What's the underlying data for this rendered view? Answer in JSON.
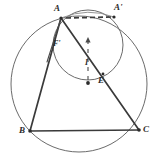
{
  "figure": {
    "background_color": "#ffffff",
    "stroke_color": "#3a3a3a",
    "thin_stroke_color": "#6b6b6b",
    "label_color": "#2b2b2b",
    "labels": [
      {
        "id": "A",
        "text": "A",
        "x": 54,
        "y": 4,
        "size": "normal"
      },
      {
        "id": "Ap",
        "text": "A'",
        "x": 114,
        "y": 4,
        "size": "normal"
      },
      {
        "id": "Fp",
        "text": "F'",
        "x": 53,
        "y": 40,
        "size": "small"
      },
      {
        "id": "I",
        "text": "I",
        "x": 84,
        "y": 59,
        "size": "small"
      },
      {
        "id": "E",
        "text": "E",
        "x": 98,
        "y": 78,
        "size": "normal"
      },
      {
        "id": "B",
        "text": "B",
        "x": 19,
        "y": 124,
        "size": "normal"
      },
      {
        "id": "C",
        "text": "C",
        "x": 142,
        "y": 124,
        "size": "normal"
      }
    ],
    "points": {
      "A": {
        "x": 61,
        "y": 18
      },
      "Ap": {
        "x": 114,
        "y": 17
      },
      "B": {
        "x": 30,
        "y": 131
      },
      "C": {
        "x": 139,
        "y": 130
      },
      "Fp": {
        "x": 52,
        "y": 48
      },
      "I": {
        "x": 88,
        "y": 81
      },
      "E": {
        "x": 103,
        "y": 74
      }
    },
    "circles": [
      {
        "id": "circumcircle",
        "name": "circumcircle-abc",
        "cx": 79,
        "cy": 84,
        "r": 68,
        "stroke": "#6b6b6b",
        "stroke_width": 1.0
      },
      {
        "id": "mixtilinear-circle",
        "name": "tangent-circle",
        "cx": 88,
        "cy": 45,
        "r": 35,
        "stroke": "#6b6b6b",
        "stroke_width": 1.0
      }
    ],
    "segments": [
      {
        "id": "AB",
        "name": "segment-a-b",
        "x1": 61,
        "y1": 18,
        "x2": 30,
        "y2": 131,
        "width": 1.6
      },
      {
        "id": "BC",
        "name": "segment-b-c",
        "x1": 30,
        "y1": 131,
        "x2": 139,
        "y2": 130,
        "width": 1.6
      },
      {
        "id": "AC",
        "name": "segment-a-c",
        "x1": 61,
        "y1": 18,
        "x2": 139,
        "y2": 130,
        "width": 1.6
      },
      {
        "id": "AFp",
        "name": "segment-a-f-prime",
        "x1": 61,
        "y1": 18,
        "x2": 48,
        "y2": 60,
        "width": 1.1
      }
    ],
    "dashed_segments": [
      {
        "id": "AAp",
        "name": "dashed-chord-a-a-prime",
        "x1": 66,
        "y1": 18,
        "x2": 112,
        "y2": 17,
        "width": 1.6,
        "dash": "5,3"
      }
    ],
    "arrow_axis": {
      "name": "incenter-vertical-axis",
      "x": 88,
      "top_y": 38,
      "bottom_y": 83,
      "dash": "4,4",
      "width": 1.1,
      "has_up_arrow": true,
      "has_bottom_dot": true
    },
    "dots": [
      {
        "id": "I-dot",
        "name": "incenter-dot",
        "x": 88,
        "y": 83,
        "r": 1.9
      },
      {
        "id": "Ap-dot",
        "name": "point-a-prime-dot",
        "x": 114,
        "y": 17,
        "r": 1.6
      },
      {
        "id": "B-dot",
        "name": "point-b-dot",
        "x": 30,
        "y": 131,
        "r": 1.7
      },
      {
        "id": "C-dot",
        "name": "point-c-dot",
        "x": 139,
        "y": 130,
        "r": 1.7
      },
      {
        "id": "E-dot",
        "name": "point-e-dot",
        "x": 103,
        "y": 74,
        "r": 1.4
      },
      {
        "id": "A-dot",
        "name": "point-a-dot",
        "x": 61,
        "y": 18,
        "r": 1.6
      }
    ]
  }
}
